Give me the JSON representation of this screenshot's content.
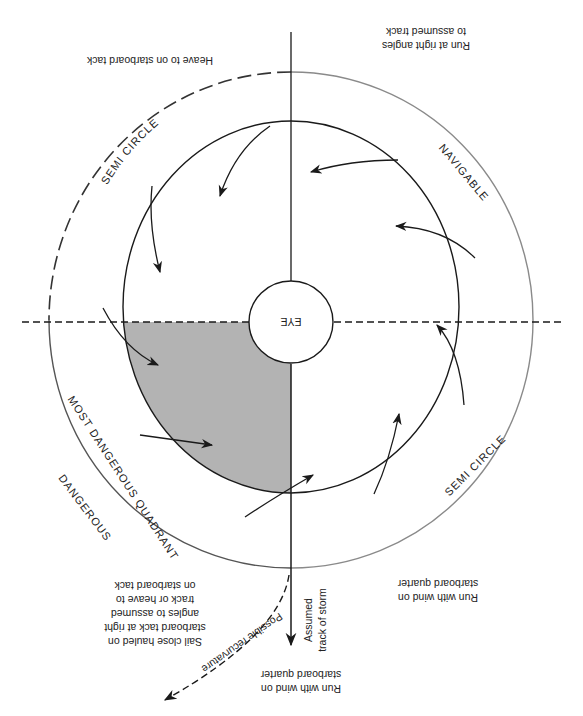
{
  "diagram": {
    "title": "",
    "orientation_note": "figure rendered rotated 180 degrees",
    "colors": {
      "line": "#1a1a1a",
      "outer_navigable": "#8a8a8a",
      "shaded_quadrant": "#b3b3b3",
      "background": "#ffffff"
    },
    "center_label": "EYE",
    "arc_labels": {
      "dangerous_semicircle_top": "SEMI CIRCLE",
      "navigable_top": "NAVIGABLE",
      "navigable_bottom": "SEMI CIRCLE",
      "dangerous_bottom": "DANGEROUS",
      "most_dangerous": "MOST DANGEROUS QUADRANT"
    },
    "instructions": {
      "top_left": [
        "Heave to on starboard tack"
      ],
      "top_right": [
        "Run at right angles",
        "to assumed track"
      ],
      "bottom_right": [
        "Run with wind on",
        "starboard quarter"
      ],
      "bottom_center": [
        "Run with wind on",
        "starboard quarter"
      ],
      "bottom_left": [
        "Sail close hauled on",
        "starboard tack at right",
        "angles to assumed",
        "track or heave to",
        "on starboard tack"
      ]
    },
    "track_labels": {
      "assumed_track_line1": "Assumed",
      "assumed_track_line2": "track of storm",
      "recurvature": "Possible recurvature"
    }
  }
}
